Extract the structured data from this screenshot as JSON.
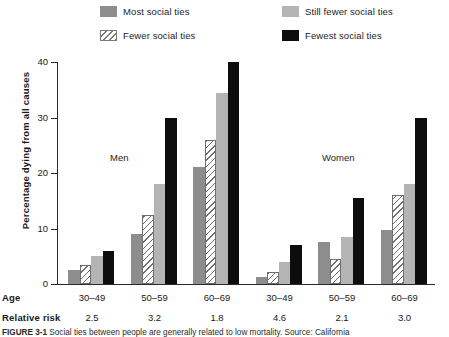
{
  "chart_data": {
    "type": "bar",
    "title": "",
    "xlabel": "Age",
    "ylabel": "Percentage dying from all causes",
    "ylim": [
      0,
      40
    ],
    "yticks": [
      0,
      10,
      20,
      30,
      40
    ],
    "grid": false,
    "legend_position": "top",
    "panels": [
      "Men",
      "Women"
    ],
    "categories": [
      "30–49",
      "50–59",
      "60–69",
      "30–49",
      "50–59",
      "60–69"
    ],
    "group_panel": [
      "Men",
      "Men",
      "Men",
      "Women",
      "Women",
      "Women"
    ],
    "relative_risk": [
      "2.5",
      "3.2",
      "1.8",
      "4.6",
      "2.1",
      "3.0"
    ],
    "series": [
      {
        "name": "Most social ties",
        "color": "#8d8d8d",
        "values": [
          2.5,
          9.0,
          21.0,
          1.3,
          7.5,
          9.8
        ]
      },
      {
        "name": "Fewer social ties",
        "color": "#ffffff",
        "pattern": "diagonal-hatch",
        "values": [
          3.5,
          12.5,
          26.0,
          2.2,
          4.5,
          16.0
        ]
      },
      {
        "name": "Still fewer social ties",
        "color": "#b4b4b4",
        "values": [
          5.0,
          18.0,
          34.5,
          4.0,
          8.5,
          18.0
        ]
      },
      {
        "name": "Fewest social ties",
        "color": "#0d0d0d",
        "values": [
          6.0,
          30.0,
          40.0,
          7.0,
          15.5,
          30.0
        ]
      }
    ]
  },
  "legend": {
    "items": [
      {
        "label": "Most social ties"
      },
      {
        "label": "Still fewer social ties"
      },
      {
        "label": "Fewer social ties"
      },
      {
        "label": "Fewest social ties"
      }
    ]
  },
  "axes": {
    "y_title": "Percentage dying from all causes",
    "y_labels": [
      "40",
      "30",
      "20",
      "10",
      "0"
    ]
  },
  "panels": {
    "men": "Men",
    "women": "Women"
  },
  "rows": {
    "age_header": "Age",
    "age_values": [
      "30–49",
      "50–59",
      "60–69",
      "30–49",
      "50–59",
      "60–69"
    ],
    "risk_header": "Relative risk",
    "risk_values": [
      "2.5",
      "3.2",
      "1.8",
      "4.6",
      "2.1",
      "3.0"
    ]
  },
  "caption": {
    "label": "FIGURE 3-1",
    "text": "Social ties between people are generally related to low mortality. Source: California"
  }
}
